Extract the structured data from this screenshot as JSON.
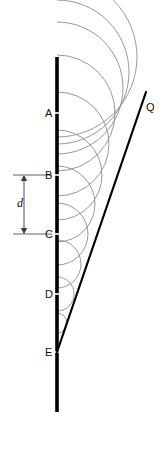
{
  "figure": {
    "type": "physics-diagram",
    "width": 164,
    "height": 452,
    "background_color": "#ffffff"
  },
  "colors": {
    "barrier": "#000000",
    "wavefront_line": "#000000",
    "wavelet_arc": "#8c8c8c",
    "dimension_line": "#3a3a3a",
    "label_text": "#111111"
  },
  "barrier": {
    "name": "vertical-barrier-line",
    "x": 57,
    "y_top": 57,
    "y_bottom": 412,
    "stroke_width": 3.6,
    "color": "#000000"
  },
  "source_points": [
    {
      "label": "A",
      "x": 57,
      "y": 113,
      "label_x": 45,
      "label_y": 108,
      "arc_radius": 58
    },
    {
      "label": "B",
      "x": 57,
      "y": 175,
      "label_x": 45,
      "label_y": 170,
      "arc_radius": 45
    },
    {
      "label": "C",
      "x": 57,
      "y": 234,
      "label_x": 45,
      "label_y": 229,
      "arc_radius": 31
    },
    {
      "label": "D",
      "x": 57,
      "y": 294,
      "label_x": 45,
      "label_y": 289,
      "arc_radius": 17
    },
    {
      "label": "E",
      "x": 57,
      "y": 352,
      "label_x": 45,
      "label_y": 347,
      "arc_radius": 3
    }
  ],
  "extra_arcs": [
    {
      "center_x": 57,
      "center_y": 57,
      "radius": 80
    },
    {
      "center_x": 57,
      "center_y": 72,
      "radius": 72
    },
    {
      "center_x": 57,
      "center_y": 88,
      "radius": 66
    },
    {
      "center_x": 57,
      "center_y": 144,
      "radius": 52
    },
    {
      "center_x": 57,
      "center_y": 204,
      "radius": 38
    },
    {
      "center_x": 57,
      "center_y": 264,
      "radius": 24
    },
    {
      "center_x": 57,
      "center_y": 323,
      "radius": 10
    }
  ],
  "wavefront": {
    "name": "tangent-wavefront-line",
    "label": "Q",
    "label_x": 146,
    "label_y": 102,
    "x1": 57,
    "y1": 352,
    "x2": 146,
    "y2": 92,
    "stroke_width": 2.2,
    "color": "#000000"
  },
  "dimension": {
    "name": "separation-dimension",
    "label": "d",
    "label_x": 17,
    "label_y": 197,
    "arrow_x": 24,
    "y_top": 175,
    "y_bottom": 234,
    "ext_line_x_start": 13,
    "ext_line_x_end": 52,
    "value_meaning": "spacing between adjacent sources"
  },
  "labels": {
    "A": "A",
    "B": "B",
    "C": "C",
    "D": "D",
    "E": "E",
    "Q": "Q",
    "d": "d"
  }
}
